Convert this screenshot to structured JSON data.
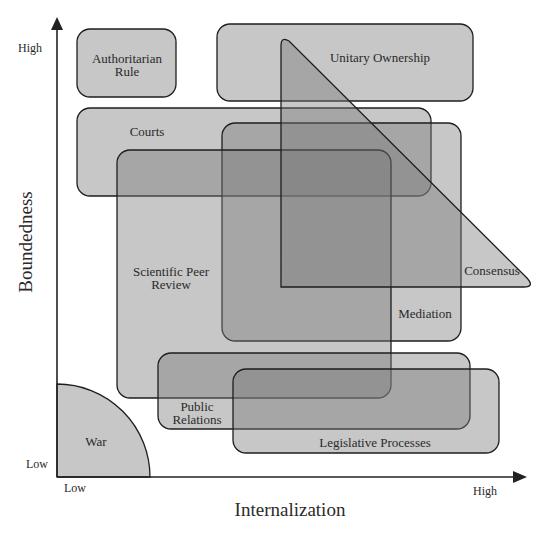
{
  "diagram": {
    "x_axis": {
      "title": "Internalization",
      "low_label": "Low",
      "high_label": "High"
    },
    "y_axis": {
      "title": "Boundedness",
      "low_label": "Low",
      "high_label": "High"
    },
    "regions": [
      {
        "id": "authoritarian-rule",
        "label_line1": "Authoritarian",
        "label_line2": "Rule",
        "shape": "rounded-rect"
      },
      {
        "id": "unitary-ownership",
        "label_line1": "Unitary Ownership",
        "shape": "rounded-rect"
      },
      {
        "id": "consensus",
        "label_line1": "Consensus",
        "shape": "triangle"
      },
      {
        "id": "courts",
        "label_line1": "Courts",
        "shape": "rounded-rect"
      },
      {
        "id": "mediation",
        "label_line1": "Mediation",
        "shape": "rounded-rect"
      },
      {
        "id": "scientific-peer-review",
        "label_line1": "Scientific Peer",
        "label_line2": "Review",
        "shape": "rounded-rect"
      },
      {
        "id": "public-relations",
        "label_line1": "Public",
        "label_line2": "Relations",
        "shape": "rounded-rect"
      },
      {
        "id": "legislative-processes",
        "label_line1": "Legislative Processes",
        "shape": "rounded-rect"
      },
      {
        "id": "war",
        "label_line1": "War",
        "shape": "quarter-circle"
      }
    ],
    "colors": {
      "fill": "#7a7a7a",
      "stroke": "#1e1e1e",
      "axis": "#222222",
      "background": "#ffffff"
    }
  }
}
